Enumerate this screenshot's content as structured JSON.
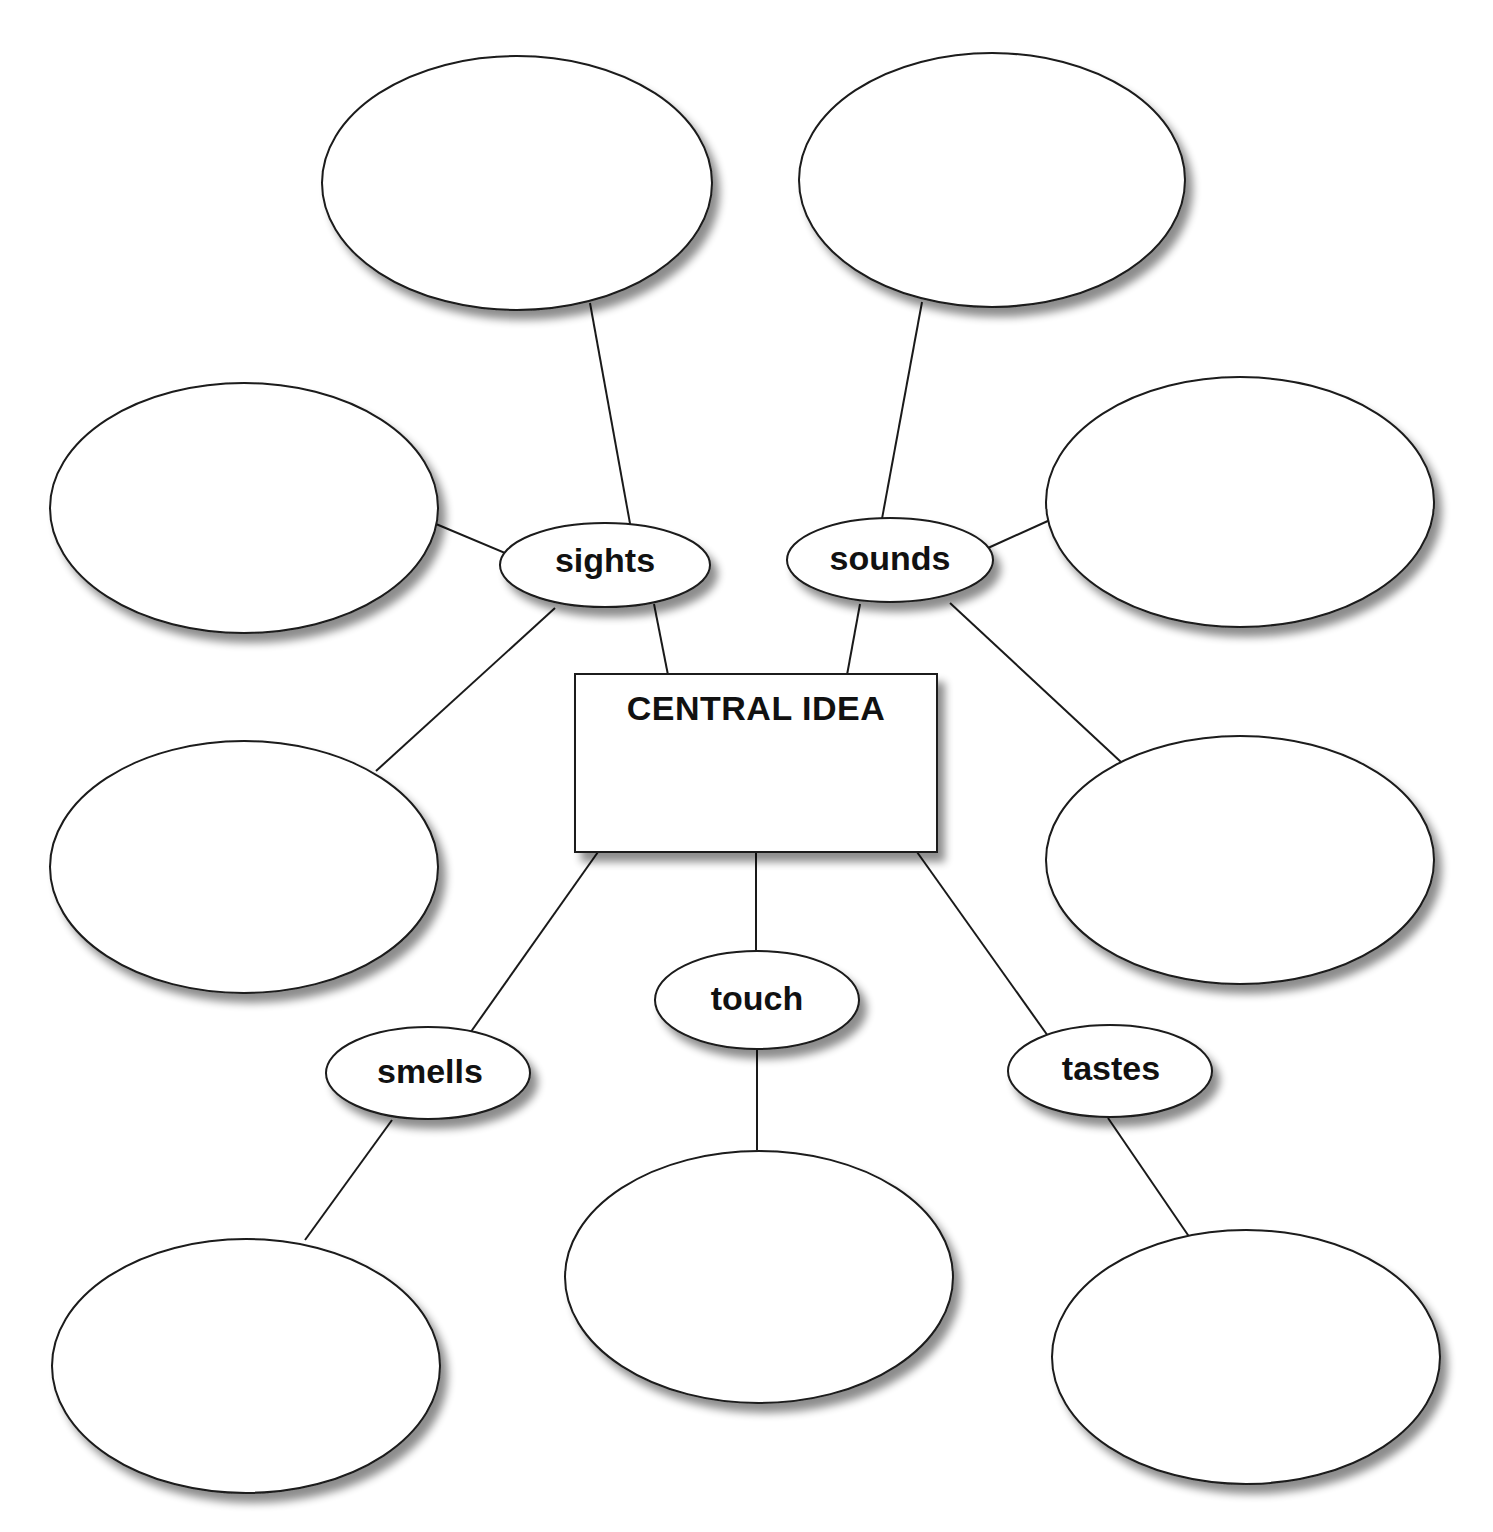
{
  "diagram": {
    "type": "sensory-details-web",
    "central": {
      "title": "CENTRAL IDEA",
      "value": ""
    },
    "senses": [
      {
        "id": "sights",
        "label": "sights"
      },
      {
        "id": "sounds",
        "label": "sounds"
      },
      {
        "id": "touch",
        "label": "touch"
      },
      {
        "id": "smells",
        "label": "smells"
      },
      {
        "id": "tastes",
        "label": "tastes"
      }
    ],
    "detail_bubbles": [
      {
        "id": "sights-top",
        "parent": "sights",
        "value": ""
      },
      {
        "id": "sights-left",
        "parent": "sights",
        "value": ""
      },
      {
        "id": "sights-lower-left",
        "parent": "sights",
        "value": ""
      },
      {
        "id": "sounds-top",
        "parent": "sounds",
        "value": ""
      },
      {
        "id": "sounds-right",
        "parent": "sounds",
        "value": ""
      },
      {
        "id": "sounds-lower-right",
        "parent": "sounds",
        "value": ""
      },
      {
        "id": "smells-bottom",
        "parent": "smells",
        "value": ""
      },
      {
        "id": "touch-bottom",
        "parent": "touch",
        "value": ""
      },
      {
        "id": "tastes-bottom",
        "parent": "tastes",
        "value": ""
      }
    ],
    "colors": {
      "stroke": "#1a1a1a",
      "fill": "#ffffff",
      "shadow": "#9a9a9a",
      "text": "#111111"
    }
  }
}
